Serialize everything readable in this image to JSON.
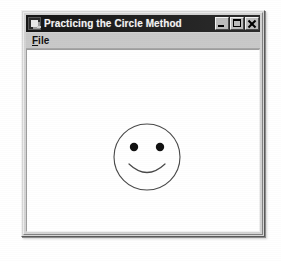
{
  "window": {
    "title": "Practicing the Circle Method",
    "app_icon": "application-icon",
    "controls": {
      "minimize_label": "Minimize",
      "maximize_label": "Maximize",
      "close_label": "Close"
    }
  },
  "menu_bar": {
    "items": [
      {
        "label": "File",
        "accelerator": "F",
        "rest": "ile"
      }
    ]
  },
  "client_area": {
    "drawing": {
      "name": "smiley-face",
      "shapes": [
        {
          "type": "circle",
          "name": "face-outline",
          "cx": 66,
          "cy": 67,
          "r": 33,
          "stroke": "#4a4a4a",
          "fill": "#ffffff"
        },
        {
          "type": "ellipse",
          "name": "left-eye",
          "cx": 53,
          "cy": 57,
          "rx": 4,
          "ry": 4,
          "fill": "#111111"
        },
        {
          "type": "ellipse",
          "name": "right-eye",
          "cx": 79,
          "cy": 57,
          "rx": 4,
          "ry": 4,
          "fill": "#111111"
        },
        {
          "type": "arc",
          "name": "mouth-smile",
          "stroke": "#4a4a4a"
        }
      ]
    }
  },
  "colors": {
    "title_bar": "#1d1d1d",
    "title_text": "#f4f4f4",
    "window_face": "#d3d3d3",
    "menu_bar": "#c9c9c9",
    "client_background": "#ffffff",
    "drawing_stroke": "#4a4a4a",
    "page_background": "#ffffff"
  }
}
